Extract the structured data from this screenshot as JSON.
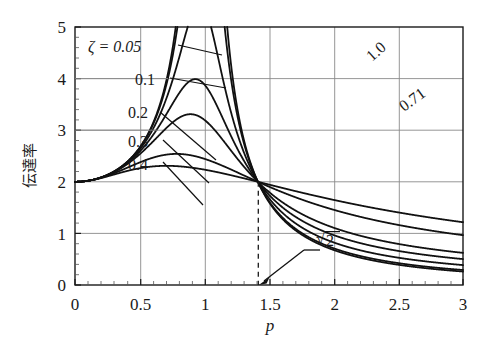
{
  "chart_data": {
    "type": "line",
    "title": "",
    "xlabel": "p",
    "ylabel": "伝達率",
    "xlim": [
      0,
      3
    ],
    "ylim": [
      0,
      5
    ],
    "xticks": [
      "0",
      "0.5",
      "1",
      "1.5",
      "2",
      "2.5",
      "3"
    ],
    "xtick_values": [
      0,
      0.5,
      1,
      1.5,
      2,
      2.5,
      3
    ],
    "yticks": [
      "0",
      "1",
      "2",
      "3",
      "4",
      "5"
    ],
    "ytick_values": [
      0,
      1,
      2,
      3,
      4,
      5
    ],
    "grid": true,
    "legend_position": "inline-annotations",
    "x_minor_tick_step": 0.1,
    "y_minor_tick_step": 0.2,
    "formula": "T = 2 * sqrt((1 + (2*z*p)^2) / ((1 - p^2)^2 + (2*z*p)^2))",
    "crossover": {
      "x": 1.4142,
      "y": 2.0,
      "label": "√2"
    },
    "series": [
      {
        "name": "0.05",
        "label": "ζ = 0.05",
        "zeta": 0.05,
        "x": [
          0,
          0.1,
          0.2,
          0.3,
          0.4,
          0.5,
          0.6,
          0.7,
          0.8,
          0.85,
          0.9,
          0.95,
          0.98,
          1.0,
          1.02,
          1.05,
          1.1,
          1.15,
          1.2,
          1.3,
          1.4142,
          1.5,
          1.6,
          1.8,
          2.0,
          2.2,
          2.5,
          2.8,
          3.0
        ],
        "values": [
          2.0,
          2.02,
          2.08,
          2.2,
          2.38,
          2.67,
          3.13,
          3.93,
          5.57,
          7.22,
          10.53,
          20.42,
          49.26,
          100.03,
          49.97,
          20.75,
          10.63,
          7.29,
          5.59,
          3.77,
          2.0,
          2.56,
          2.29,
          1.93,
          1.74,
          1.62,
          1.51,
          1.44,
          1.4
        ]
      },
      {
        "name": "0.1",
        "label": "0.1",
        "zeta": 0.1,
        "x": [
          0,
          0.1,
          0.2,
          0.3,
          0.4,
          0.5,
          0.6,
          0.7,
          0.8,
          0.85,
          0.9,
          0.95,
          0.98,
          1.0,
          1.02,
          1.05,
          1.1,
          1.15,
          1.2,
          1.3,
          1.4142,
          1.5,
          1.6,
          1.8,
          2.0,
          2.2,
          2.5,
          2.8,
          3.0
        ],
        "values": [
          2.0,
          2.02,
          2.08,
          2.2,
          2.38,
          2.67,
          3.13,
          3.91,
          5.48,
          6.95,
          9.64,
          14.97,
          22.26,
          25.08,
          21.41,
          14.51,
          9.08,
          6.43,
          5.04,
          3.56,
          2.0,
          2.52,
          2.27,
          1.92,
          1.73,
          1.61,
          1.51,
          1.44,
          1.4
        ]
      },
      {
        "name": "0.2",
        "label": "0.2",
        "zeta": 0.2,
        "x": [
          0,
          0.1,
          0.2,
          0.3,
          0.4,
          0.5,
          0.6,
          0.7,
          0.8,
          0.85,
          0.9,
          0.95,
          0.98,
          1.0,
          1.02,
          1.05,
          1.1,
          1.15,
          1.2,
          1.3,
          1.4142,
          1.5,
          1.6,
          1.8,
          2.0,
          2.2,
          2.5,
          2.8,
          3.0
        ],
        "values": [
          2.0,
          2.02,
          2.08,
          2.19,
          2.36,
          2.62,
          3.02,
          3.64,
          4.63,
          5.22,
          5.83,
          6.3,
          6.43,
          6.4,
          6.29,
          5.99,
          5.25,
          4.48,
          3.84,
          2.95,
          2.0,
          2.31,
          2.12,
          1.83,
          1.67,
          1.57,
          1.48,
          1.42,
          1.39
        ]
      },
      {
        "name": "0.3",
        "label": "0.3",
        "zeta": 0.3,
        "x": [
          0,
          0.1,
          0.2,
          0.3,
          0.4,
          0.5,
          0.6,
          0.7,
          0.8,
          0.85,
          0.9,
          0.95,
          1.0,
          1.05,
          1.1,
          1.15,
          1.2,
          1.3,
          1.4142,
          1.5,
          1.6,
          1.8,
          2.0,
          2.2,
          2.5,
          2.8,
          3.0
        ],
        "values": [
          2.0,
          2.02,
          2.07,
          2.18,
          2.33,
          2.55,
          2.85,
          3.25,
          3.72,
          3.93,
          4.09,
          4.17,
          4.16,
          4.07,
          3.89,
          3.66,
          3.41,
          2.86,
          2.0,
          2.15,
          2.0,
          1.76,
          1.62,
          1.53,
          1.45,
          1.4,
          1.37
        ]
      },
      {
        "name": "0.4",
        "label": "0.4",
        "zeta": 0.4,
        "x": [
          0,
          0.1,
          0.2,
          0.3,
          0.4,
          0.5,
          0.6,
          0.7,
          0.8,
          0.85,
          0.9,
          0.95,
          1.0,
          1.05,
          1.1,
          1.15,
          1.2,
          1.3,
          1.4142,
          1.5,
          1.6,
          1.8,
          2.0,
          2.2,
          2.5,
          2.8,
          3.0
        ],
        "values": [
          2.0,
          2.02,
          2.07,
          2.16,
          2.29,
          2.47,
          2.69,
          2.93,
          3.14,
          3.2,
          3.23,
          3.22,
          3.17,
          3.08,
          2.96,
          2.82,
          2.67,
          2.37,
          2.0,
          1.99,
          1.87,
          1.68,
          1.56,
          1.48,
          1.41,
          1.37,
          1.35
        ]
      },
      {
        "name": "0.71",
        "label": "0.71",
        "zeta": 0.71,
        "x": [
          0,
          0.1,
          0.2,
          0.3,
          0.4,
          0.5,
          0.6,
          0.7,
          0.8,
          0.9,
          1.0,
          1.1,
          1.2,
          1.3,
          1.4142,
          1.5,
          1.6,
          1.8,
          2.0,
          2.2,
          2.5,
          2.8,
          3.0
        ],
        "values": [
          2.0,
          2.01,
          2.04,
          2.08,
          2.13,
          2.18,
          2.23,
          2.26,
          2.27,
          2.25,
          2.21,
          2.16,
          2.1,
          2.04,
          2.0,
          2.01,
          2.06,
          2.24,
          2.52,
          2.86,
          3.43,
          4.04,
          4.46
        ]
      },
      {
        "name": "1.0",
        "label": "1.0",
        "zeta": 1.0,
        "x": [
          0,
          0.1,
          0.2,
          0.3,
          0.4,
          0.5,
          0.6,
          0.7,
          0.8,
          0.9,
          1.0,
          1.1,
          1.2,
          1.3,
          1.4142,
          1.5,
          1.6,
          1.8,
          2.0,
          2.2,
          2.5,
          2.8,
          3.0
        ],
        "values": [
          2.0,
          2.01,
          2.03,
          2.05,
          2.07,
          2.08,
          2.08,
          2.07,
          2.05,
          2.03,
          2.0,
          1.99,
          1.99,
          1.99,
          2.0,
          2.06,
          2.18,
          2.54,
          3.0,
          3.52,
          4.36,
          5.24,
          5.85
        ]
      }
    ],
    "annotations": [
      {
        "name": "zeta-005",
        "text": "ζ = 0.05"
      },
      {
        "name": "zeta-01",
        "text": "0.1"
      },
      {
        "name": "zeta-02",
        "text": "0.2"
      },
      {
        "name": "zeta-03",
        "text": "0.3"
      },
      {
        "name": "zeta-04",
        "text": "0.4"
      },
      {
        "name": "zeta-10",
        "text": "1.0"
      },
      {
        "name": "zeta-071",
        "text": "0.71"
      },
      {
        "name": "sqrt2",
        "text": "√2"
      }
    ]
  },
  "axes": {
    "x_title": "p",
    "y_title": "伝達率",
    "x_tick_0": "0",
    "x_tick_1": "0.5",
    "x_tick_2": "1",
    "x_tick_3": "1.5",
    "x_tick_4": "2",
    "x_tick_5": "2.5",
    "x_tick_6": "3",
    "y_tick_0": "0",
    "y_tick_1": "1",
    "y_tick_2": "2",
    "y_tick_3": "3",
    "y_tick_4": "4",
    "y_tick_5": "5"
  },
  "labels": {
    "zeta_005": "ζ = 0.05",
    "zeta_01": "0.1",
    "zeta_02": "0.2",
    "zeta_03": "0.3",
    "zeta_04": "0.4",
    "curve_10": "1.0",
    "curve_071": "0.71",
    "sqrt2": "2",
    "sqrt_sign": "√"
  },
  "colors": {
    "curve": "#111111",
    "grid": "#8a8a8a",
    "axis": "#1a1a1a",
    "background": "#ffffff"
  }
}
